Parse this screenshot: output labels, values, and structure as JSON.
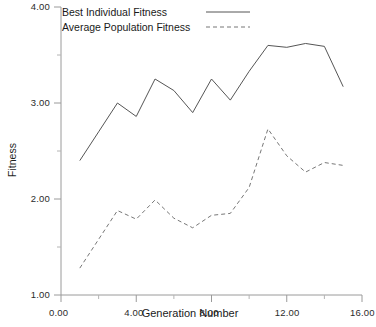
{
  "chart_data": {
    "type": "line",
    "title": "",
    "xlabel": "Generation Number",
    "ylabel": "Fitness",
    "xlim": [
      0.0,
      16.0
    ],
    "ylim": [
      1.0,
      4.0
    ],
    "grid": false,
    "legend_position": "top-left-inside",
    "x_ticks": [
      "0.00",
      "4.00",
      "8.00",
      "12.00",
      "16.00"
    ],
    "x_tick_values": [
      0,
      4,
      8,
      12,
      16
    ],
    "y_ticks": [
      "1.00",
      "2.00",
      "3.00",
      "4.00"
    ],
    "y_tick_values": [
      1,
      2,
      3,
      4
    ],
    "x": [
      1,
      2,
      3,
      4,
      5,
      6,
      7,
      8,
      9,
      10,
      11,
      12,
      13,
      14,
      15
    ],
    "series": [
      {
        "name": "Best Individual Fitness",
        "style": "solid",
        "color": "#555555",
        "values": [
          2.4,
          2.7,
          3.0,
          2.86,
          3.25,
          3.13,
          2.9,
          3.25,
          3.03,
          3.33,
          3.6,
          3.58,
          3.62,
          3.59,
          3.17
        ]
      },
      {
        "name": "Average Population Fitness",
        "style": "dashed",
        "color": "#777777",
        "values": [
          1.28,
          1.58,
          1.88,
          1.79,
          1.99,
          1.8,
          1.7,
          1.83,
          1.85,
          2.12,
          2.73,
          2.45,
          2.28,
          2.38,
          2.35
        ]
      }
    ]
  },
  "legend": {
    "entries": [
      {
        "label": "Best Individual Fitness",
        "style": "solid"
      },
      {
        "label": "Average Population Fitness",
        "style": "dashed"
      }
    ]
  },
  "axes": {
    "y_title": "Fitness",
    "x_title": "Generation Number"
  }
}
